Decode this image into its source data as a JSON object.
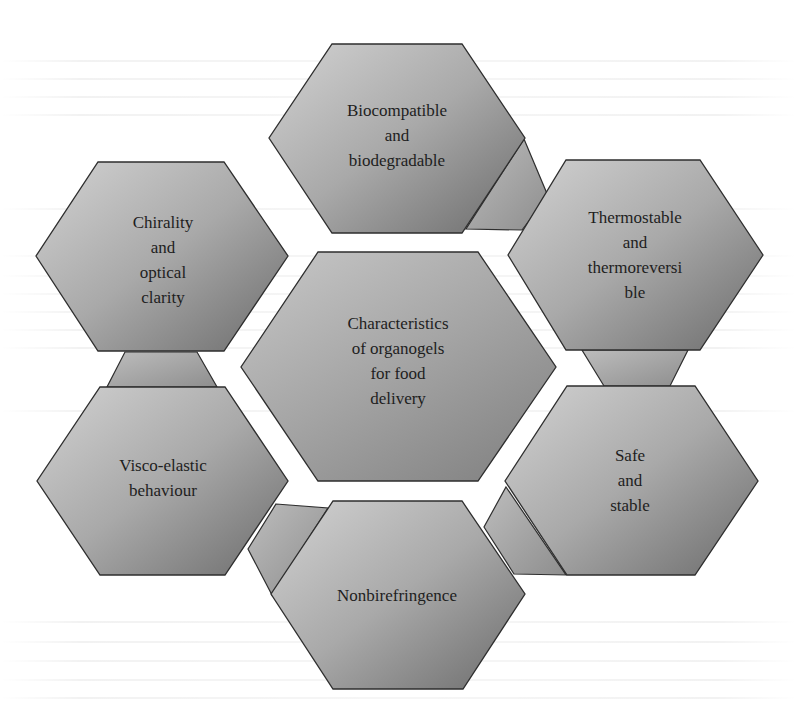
{
  "diagram": {
    "type": "hexagon-cluster",
    "center": {
      "label": "Characteristics\nof organogels\nfor food\ndelivery"
    },
    "nodes": [
      {
        "id": "top",
        "label": "Biocompatible\nand\nbiodegradable"
      },
      {
        "id": "top-right",
        "label": "Thermostable\nand\nthermoreversi\nble"
      },
      {
        "id": "bottom-right",
        "label": "Safe\nand\nstable"
      },
      {
        "id": "bottom",
        "label": "Nonbirefringence"
      },
      {
        "id": "bottom-left",
        "label": "Visco-elastic\nbehaviour"
      },
      {
        "id": "top-left",
        "label": "Chirality\nand\noptical\nclarity"
      }
    ],
    "colors": {
      "fill_light": "#cdcdcd",
      "fill_dark": "#6f6f6f",
      "connector_light": "#b9b9b9",
      "connector_dark": "#8c8c8c",
      "stroke": "#2e2e2e",
      "text": "#1e1e1e",
      "background": "#ffffff"
    }
  }
}
